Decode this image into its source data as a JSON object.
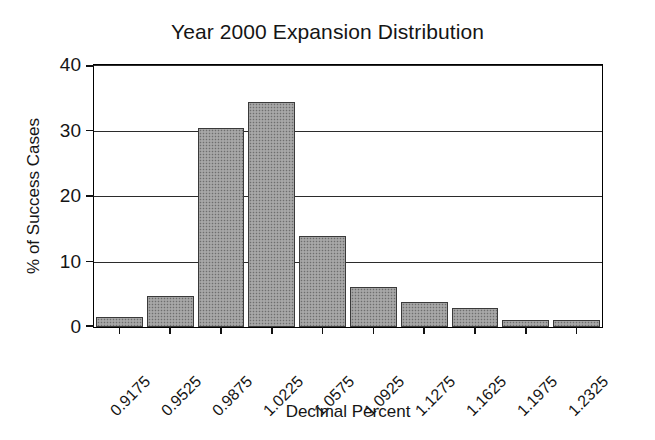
{
  "chart_data": {
    "type": "bar",
    "title": "Year 2000 Expansion Distribution",
    "xlabel": "Decimal Percent",
    "ylabel": "% of Success Cases",
    "categories": [
      "0.9175",
      "0.9525",
      "0.9875",
      "1.0225",
      "1.0575",
      "1.0925",
      "1.1275",
      "1.1625",
      "1.1975",
      "1.2325"
    ],
    "values": [
      1.6,
      4.8,
      30.4,
      34.4,
      13.9,
      6.1,
      3.8,
      2.9,
      1.0,
      1.0
    ],
    "ylim": [
      0,
      40
    ],
    "yticks": [
      0,
      10,
      20,
      30,
      40
    ],
    "ytick_labels": [
      "0",
      "10",
      "20",
      "30",
      "40"
    ],
    "grid": true,
    "grid_axis": "y",
    "legend": null,
    "bar_fill_color": "#9b9b9b",
    "bar_edge_color": "#3a3a3a",
    "axis_color": "#111111",
    "background_color": "#ffffff",
    "xtick_label_rotation": -45,
    "bar_gap_ratio": 0.08
  }
}
